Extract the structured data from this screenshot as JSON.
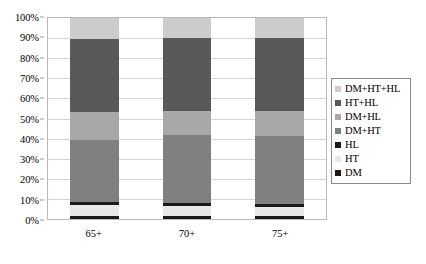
{
  "chart_data": {
    "type": "bar",
    "subtype": "stacked-percentage",
    "title": "",
    "xlabel": "",
    "ylabel": "",
    "ylim": [
      0,
      100
    ],
    "yticks": [
      0,
      10,
      20,
      30,
      40,
      50,
      60,
      70,
      80,
      90,
      100
    ],
    "ytick_labels": [
      "0%",
      "10%",
      "20%",
      "30%",
      "40%",
      "50%",
      "60%",
      "70%",
      "80%",
      "90%",
      "100%"
    ],
    "grid": true,
    "legend_position": "right",
    "categories": [
      "65+",
      "70+",
      "75+"
    ],
    "series": [
      {
        "name": "DM",
        "color": "#1a1a1a",
        "values": [
          1.5,
          1.5,
          1.5
        ]
      },
      {
        "name": "HT",
        "color": "#e8e8e8",
        "values": [
          5.5,
          5.0,
          4.5
        ]
      },
      {
        "name": "HL",
        "color": "#1a1a1a",
        "values": [
          1.5,
          1.5,
          1.5
        ]
      },
      {
        "name": "DM+HT",
        "color": "#808080",
        "values": [
          31.0,
          34.0,
          34.0
        ]
      },
      {
        "name": "DM+HL",
        "color": "#a8a8a8",
        "values": [
          14.0,
          12.0,
          12.5
        ]
      },
      {
        "name": "HT+HL",
        "color": "#595959",
        "values": [
          36.0,
          36.0,
          36.0
        ]
      },
      {
        "name": "DM+HT+HL",
        "color": "#cccccc",
        "values": [
          10.5,
          10.0,
          10.0
        ]
      }
    ],
    "legend_order": [
      "DM+HT+HL",
      "HT+HL",
      "DM+HL",
      "DM+HT",
      "HL",
      "HT",
      "DM"
    ]
  },
  "axis": {
    "plot_border_color": "#b9b9b9",
    "grid_color": "#d4d4d4"
  }
}
